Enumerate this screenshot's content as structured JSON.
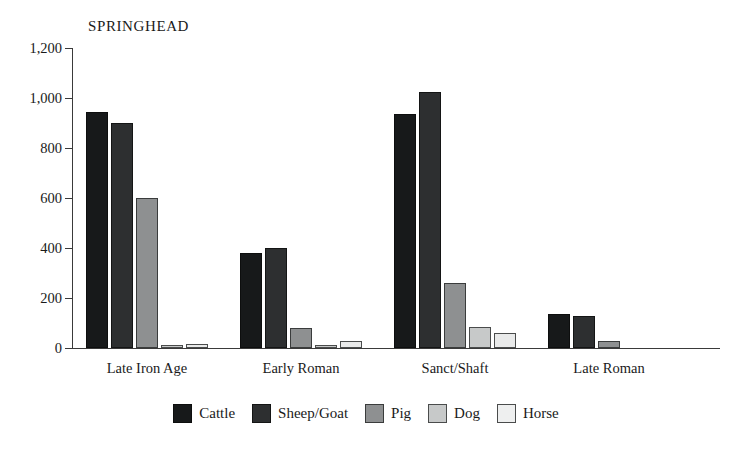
{
  "chart_data": {
    "type": "bar",
    "title": "SPRINGHEAD",
    "xlabel": "",
    "ylabel": "",
    "ylim": [
      0,
      1200
    ],
    "ytick_labels": [
      "1,200",
      "1,000",
      "800",
      "600",
      "400",
      "200",
      "0"
    ],
    "ytick_values": [
      1200,
      1000,
      800,
      600,
      400,
      200,
      0
    ],
    "grid": false,
    "legend_position": "bottom",
    "categories": [
      "Late Iron Age",
      "Early Roman",
      "Sanct/Shaft",
      "Late Roman"
    ],
    "series": [
      {
        "name": "Cattle",
        "color": "#17191a",
        "values": [
          945,
          382,
          935,
          135
        ]
      },
      {
        "name": "Sheep/Goat",
        "color": "#2d2f30",
        "values": [
          900,
          400,
          1025,
          128
        ]
      },
      {
        "name": "Pig",
        "color": "#8e9091",
        "values": [
          602,
          82,
          260,
          30
        ]
      },
      {
        "name": "Dog",
        "color": "#c7c9c9",
        "values": [
          10,
          10,
          85,
          0
        ]
      },
      {
        "name": "Horse",
        "color": "#e9eaea",
        "values": [
          16,
          30,
          62,
          0
        ]
      }
    ]
  },
  "axis": {
    "baseline_label": "0"
  }
}
